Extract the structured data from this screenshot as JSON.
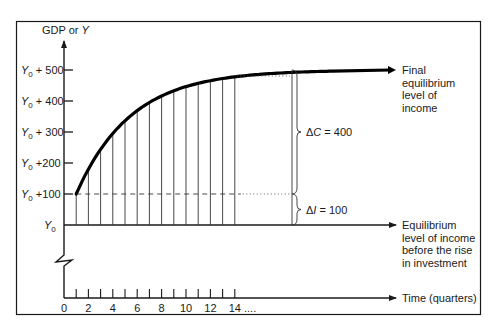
{
  "chart_data": {
    "type": "line",
    "title": "",
    "ylabel": "GDP or Y",
    "xlabel": "Time (quarters)",
    "y_base_symbol": "Y",
    "y_base_subscript": "0",
    "y_ticks": [
      {
        "value": 0,
        "prefix": "Y",
        "sub": "0",
        "suffix": ""
      },
      {
        "value": 100,
        "prefix": "Y",
        "sub": "0",
        "suffix": " +100"
      },
      {
        "value": 200,
        "prefix": "Y",
        "sub": "0",
        "suffix": " +200"
      },
      {
        "value": 300,
        "prefix": "Y",
        "sub": "0",
        "suffix": " + 300"
      },
      {
        "value": 400,
        "prefix": "Y",
        "sub": "0",
        "suffix": " + 400"
      },
      {
        "value": 500,
        "prefix": "Y",
        "sub": "0",
        "suffix": " + 500"
      }
    ],
    "ylim": [
      0,
      500
    ],
    "xlim": [
      0,
      14
    ],
    "x_ticks": [
      0,
      1,
      2,
      3,
      4,
      5,
      6,
      7,
      8,
      9,
      10,
      11,
      12,
      13,
      14
    ],
    "x_tick_labels": [
      "0",
      "2",
      "4",
      "6",
      "8",
      "10",
      "12",
      "14"
    ],
    "x_labeled_values": [
      0,
      2,
      4,
      6,
      8,
      10,
      12,
      14
    ],
    "x_continuation": "....",
    "series": [
      {
        "name": "Income path after rise in investment (increase over Y0)",
        "x": [
          1,
          2,
          3,
          4,
          5,
          6,
          7,
          8,
          9,
          10,
          11,
          12,
          13,
          14
        ],
        "values": [
          100,
          180,
          244,
          295,
          336,
          369,
          395,
          416,
          433,
          446,
          457,
          466,
          473,
          478
        ]
      }
    ],
    "final_level": 500,
    "initial_investment_increase": 100,
    "annotations": {
      "delta_c": {
        "symbol": "Δ",
        "var": "C",
        "text": " = 400",
        "value": 400
      },
      "delta_i": {
        "symbol": "Δ",
        "var": "I",
        "text": " = 100",
        "value": 100
      },
      "final_label": [
        "Final",
        "equilibrium",
        "level of",
        "income"
      ],
      "initial_label": [
        "Equilibrium",
        "level of income",
        "before the rise",
        "in investment"
      ]
    },
    "grid": false,
    "legend": "none"
  }
}
